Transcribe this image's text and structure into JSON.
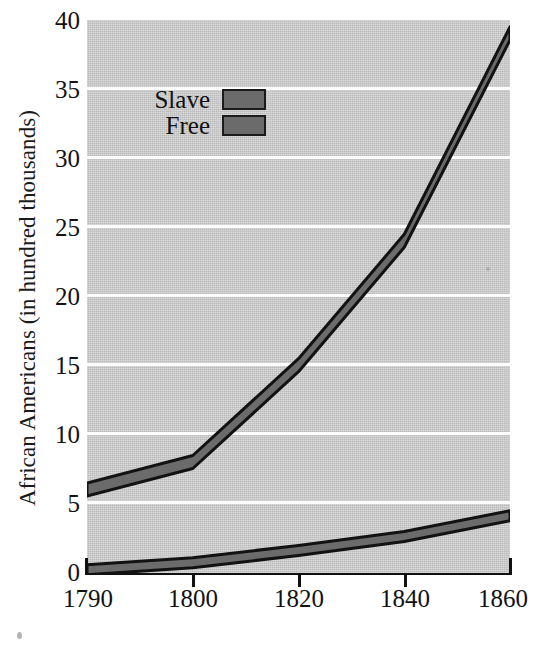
{
  "chart_data": {
    "type": "area",
    "title": "",
    "xlabel": "Years",
    "ylabel": "African Americans (in hundred thousands)",
    "categories": [
      "1790",
      "1800",
      "1820",
      "1840",
      "1860"
    ],
    "x": [
      1790,
      1800,
      1820,
      1840,
      1860
    ],
    "series": [
      {
        "name": "Slave",
        "values": [
          6.5,
          8.5,
          15.5,
          24.5,
          39.5
        ],
        "color": "#6b6b6b"
      },
      {
        "name": "Free",
        "values": [
          0.6,
          1.1,
          2.0,
          3.0,
          4.5
        ],
        "color": "#6b6b6b"
      }
    ],
    "ylim": [
      0,
      40
    ],
    "yticks": [
      0,
      5,
      10,
      15,
      20,
      25,
      30,
      35,
      40
    ],
    "ytick_labels": [
      "0",
      "5",
      "10",
      "15",
      "20",
      "25",
      "30",
      "35",
      "40"
    ],
    "grid": true,
    "legend_position": "upper left",
    "plot_background": "#c9c9c9",
    "gridline_color": "#fdfdfd",
    "band_fill": "#6b6b6b",
    "band_outline": "#121212",
    "axis_color": "#111111"
  },
  "legend": {
    "entries": [
      {
        "label": "Slave",
        "swatch": "#6b6b6b"
      },
      {
        "label": "Free",
        "swatch": "#6b6b6b"
      }
    ]
  },
  "axes": {
    "y_title": "African Americans (in hundred thousands)",
    "x_title": "Years",
    "y_tick_labels": [
      "40",
      "35",
      "30",
      "25",
      "20",
      "15",
      "10",
      "5",
      "0"
    ],
    "x_tick_labels": [
      "1790",
      "1800",
      "1820",
      "1840",
      "1860"
    ]
  }
}
